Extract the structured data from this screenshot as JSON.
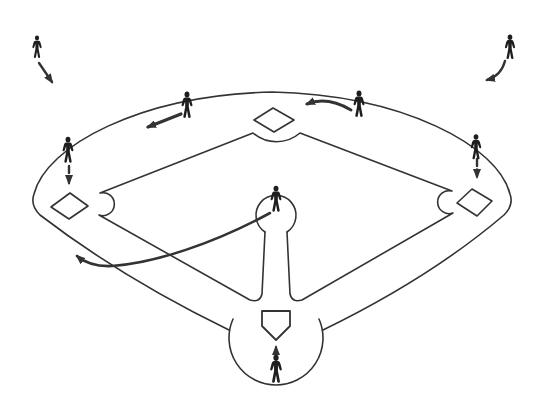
{
  "canvas": {
    "width": 540,
    "height": 410,
    "background": "#ffffff",
    "line_color": "#333333",
    "figure_color": "#1e1e1e"
  },
  "field": {
    "outline": "M 229,330 Q 122,278 40,215 Q 30,205 34,194 C 46,146 140,95 272,92 C 404,95 498,146 510,194 Q 514,205 504,215 Q 430,278 323,330",
    "home_circle": "M 233,319 A 47 47 0 1 0 319,319",
    "mound_circle": "M 265,232 A 20 20 0 1 1 287,232",
    "infield_grass": "M 265,232 L 262,294 Q 260,303 250,300 L 99,215 A 11.5 11.5 0 1 0 100,193 L 253,133 A 36 36 0 0 0 300,133 L 452,191 A 11.5 11.5 0 1 0 453,213 L 302,300 Q 292,303 290,294 L 287,232",
    "bases": {
      "second": "254,120 273,108 294,120 274,132",
      "third": "51,207 70,193 88,206 69,219",
      "first": "457,203 472,189 492,201 477,216"
    },
    "home_plate": "262,311 290,311 290,326 276,340 262,326"
  },
  "players": [
    {
      "role": "left-fielder",
      "x": 37,
      "y": 47,
      "scale": 0.92,
      "arrow": {
        "d": "M 39,63 L 52,82",
        "width": 2.4,
        "dash": null
      }
    },
    {
      "role": "right-fielder",
      "x": 510,
      "y": 47,
      "scale": 1.0,
      "arrow": {
        "d": "M 505,61 Q 501,76 487,80",
        "width": 2.4,
        "dash": null
      }
    },
    {
      "role": "shortstop",
      "x": 187,
      "y": 105,
      "scale": 1.08,
      "arrow": {
        "d": "M 181,114 L 148,127",
        "width": 3.2,
        "dash": null
      }
    },
    {
      "role": "second-baseman",
      "x": 359,
      "y": 104,
      "scale": 1.08,
      "arrow": {
        "d": "M 351,110 Q 327,96 307,104",
        "width": 3.0,
        "dash": null
      }
    },
    {
      "role": "third-baseman",
      "x": 68,
      "y": 150,
      "scale": 1.07,
      "arrow": {
        "d": "M 69,166 L 69,183",
        "width": 2.4,
        "dash": "7 3.5"
      }
    },
    {
      "role": "first-baseman",
      "x": 476,
      "y": 147,
      "scale": 1.03,
      "arrow": {
        "d": "M 477,159 L 477,177",
        "width": 2.4,
        "dash": "7 3.5"
      }
    },
    {
      "role": "pitcher",
      "x": 276,
      "y": 199,
      "scale": 1.07,
      "arrow": {
        "d": "M 270,213 C 215,243 155,263 112,266 Q 90,267 77,256",
        "width": 2.6,
        "dash": null
      }
    },
    {
      "role": "catcher",
      "x": 276,
      "y": 369,
      "scale": 1.15,
      "arrow": {
        "d": "M 276,355 L 276,347",
        "width": 2.2,
        "dash": null
      }
    }
  ]
}
